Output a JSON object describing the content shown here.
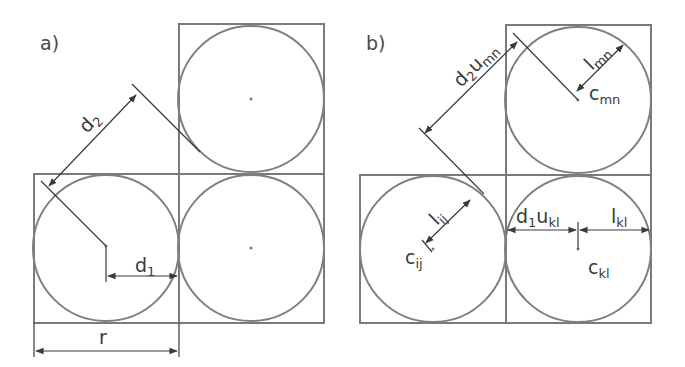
{
  "panels": {
    "a": {
      "label": "a)",
      "dims": {
        "d2": {
          "main": "d",
          "sub": "2"
        },
        "d1": {
          "main": "d",
          "sub": "1"
        },
        "r": {
          "main": "r"
        }
      }
    },
    "b": {
      "label": "b)",
      "dims": {
        "d2u": {
          "main": "d",
          "sub": "2",
          "main2": "u",
          "sub2": "mn"
        },
        "lmn": {
          "main": "l",
          "sub": "mn"
        },
        "cmn": {
          "main": "c",
          "sub": "mn"
        },
        "lij": {
          "main": "l",
          "sub": "ij"
        },
        "cij": {
          "main": "c",
          "sub": "ij"
        },
        "d1u": {
          "main": "d",
          "sub": "1",
          "main2": "u",
          "sub2": "kl"
        },
        "lkl": {
          "main": "l",
          "sub": "kl"
        },
        "ckl": {
          "main": "c",
          "sub": "kl"
        }
      }
    }
  },
  "colors": {
    "shape_stroke": "#7f7f7f",
    "annotation_stroke": "#3a3a3a",
    "background": "#ffffff"
  }
}
